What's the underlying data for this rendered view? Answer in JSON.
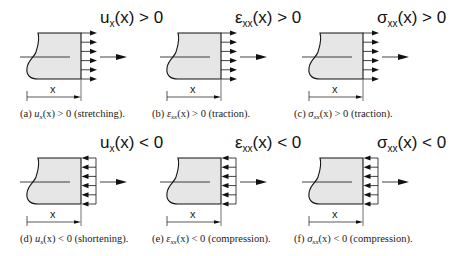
{
  "figure": {
    "panels": [
      {
        "id": "a",
        "title_sym": "u",
        "title_sub": "x",
        "title_rest": "(x) > 0",
        "caption_tag": "(a)",
        "caption_sym": "u",
        "caption_sub": "x",
        "caption_rest": "(x) > 0 (stretching).",
        "dim_label": "x",
        "arrows": "out",
        "x": 0,
        "y": 0
      },
      {
        "id": "b",
        "title_sym": "ε",
        "title_sub": "xx",
        "title_rest": "(x) > 0",
        "caption_tag": "(b)",
        "caption_sym": "ε",
        "caption_sub": "xx",
        "caption_rest": "(x) > 0 (traction).",
        "dim_label": "x",
        "arrows": "out",
        "x": 140,
        "y": 0
      },
      {
        "id": "c",
        "title_sym": "σ",
        "title_sub": "xx",
        "title_rest": "(x) > 0",
        "caption_tag": "(c)",
        "caption_sym": "σ",
        "caption_sub": "xx",
        "caption_rest": "(x) > 0 (traction).",
        "dim_label": "x",
        "arrows": "out",
        "x": 282,
        "y": 0
      },
      {
        "id": "d",
        "title_sym": "u",
        "title_sub": "x",
        "title_rest": "(x) < 0",
        "caption_tag": "(d)",
        "caption_sym": "u",
        "caption_sub": "x",
        "caption_rest": "(x) < 0 (shortening).",
        "dim_label": "x",
        "arrows": "in",
        "x": 0,
        "y": 125
      },
      {
        "id": "e",
        "title_sym": "ε",
        "title_sub": "xx",
        "title_rest": "(x) < 0",
        "caption_tag": "(e)",
        "caption_sym": "ε",
        "caption_sub": "xx",
        "caption_rest": "(x) < 0 (compression).",
        "dim_label": "x",
        "arrows": "in",
        "x": 140,
        "y": 125
      },
      {
        "id": "f",
        "title_sym": "σ",
        "title_sub": "xx",
        "title_rest": "(x) < 0",
        "caption_tag": "(f)",
        "caption_sym": "σ",
        "caption_sub": "xx",
        "caption_rest": "(x) < 0 (compression).",
        "dim_label": "x",
        "arrows": "in",
        "x": 282,
        "y": 125
      }
    ],
    "colors": {
      "fill": "#e6e6e6",
      "stroke": "#111111",
      "background": "#ffffff"
    }
  }
}
